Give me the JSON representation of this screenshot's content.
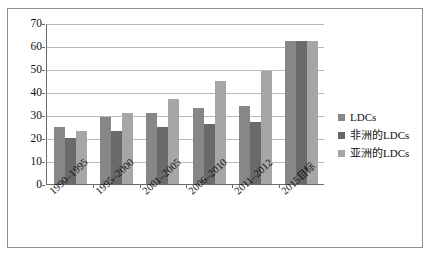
{
  "chart_data": {
    "type": "bar",
    "title": "",
    "subtitle": "",
    "xlabel": "",
    "ylabel": "",
    "categories": [
      "1990–1995",
      "1995–2000",
      "2001–2005",
      "2006–2010",
      "2011–2012",
      "2015目标"
    ],
    "series": [
      {
        "name": "LDCs",
        "color": "#878787",
        "values": [
          25,
          29,
          31,
          33,
          34,
          62
        ]
      },
      {
        "name": "非洲的LDCs",
        "color": "#6a6a6a",
        "values": [
          20,
          23,
          25,
          26,
          27,
          62
        ]
      },
      {
        "name": "亚洲的LDCs",
        "color": "#a6a6a6",
        "values": [
          23,
          31,
          37,
          45,
          49,
          62
        ]
      }
    ],
    "ylim": [
      0,
      70
    ],
    "yticks": [
      0,
      10,
      20,
      30,
      40,
      50,
      60,
      70
    ],
    "ytick_labels": [
      "0",
      "10",
      "20",
      "30",
      "40",
      "50",
      "60",
      "70"
    ],
    "grid": true,
    "legend_position": "right",
    "legend_entries": [
      "LDCs",
      "非洲的LDCs",
      "亚洲的LDCs"
    ]
  },
  "frame": {
    "border_color": "#8d8f94",
    "background": "#ffffff"
  }
}
